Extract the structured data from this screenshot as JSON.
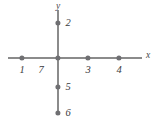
{
  "figure": {
    "kind": "coordinate-axes-points-diagram",
    "width": 161,
    "height": 124,
    "background_color": "#ffffff",
    "axis_color": "#8b8b8b",
    "point_color": "#6f6f72",
    "label_color": "#3a3a3c"
  },
  "chart_data": {
    "type": "scatter",
    "title": "",
    "xlabel": "x",
    "ylabel": "y",
    "grid": false,
    "legend": null,
    "axis_labels": {
      "x": "x",
      "y": "y"
    },
    "origin_px": {
      "x": 58,
      "y": 58
    },
    "axis_extent_px": {
      "x_start": 8,
      "x_end": 142,
      "y_start": 10,
      "y_end": 114
    },
    "points": [
      {
        "label": "1",
        "on_axis": "x",
        "px_x": 22,
        "px_y": 58,
        "label_px_x": 22,
        "label_px_y": 70,
        "label_side": "below"
      },
      {
        "label": "2",
        "on_axis": "y",
        "px_x": 58,
        "px_y": 23,
        "label_px_x": 68,
        "label_px_y": 23,
        "label_side": "right"
      },
      {
        "label": "3",
        "on_axis": "x",
        "px_x": 88,
        "px_y": 58,
        "label_px_x": 88,
        "label_px_y": 70,
        "label_side": "below"
      },
      {
        "label": "4",
        "on_axis": "x",
        "px_x": 119,
        "px_y": 58,
        "label_px_x": 119,
        "label_px_y": 70,
        "label_side": "below"
      },
      {
        "label": "5",
        "on_axis": "y",
        "px_x": 58,
        "px_y": 87,
        "label_px_x": 68,
        "label_px_y": 87,
        "label_side": "right"
      },
      {
        "label": "6",
        "on_axis": "y",
        "px_x": 58,
        "px_y": 113,
        "label_px_x": 68,
        "label_px_y": 113,
        "label_side": "right"
      },
      {
        "label": "7",
        "on_axis": "origin",
        "px_x": 58,
        "px_y": 58,
        "label_px_x": 41,
        "label_px_y": 70,
        "label_side": "below-left"
      }
    ],
    "axis_name_positions": {
      "x_label_px_x": 148,
      "x_label_px_y": 56,
      "y_label_px_x": 58,
      "y_label_px_y": 7
    }
  }
}
